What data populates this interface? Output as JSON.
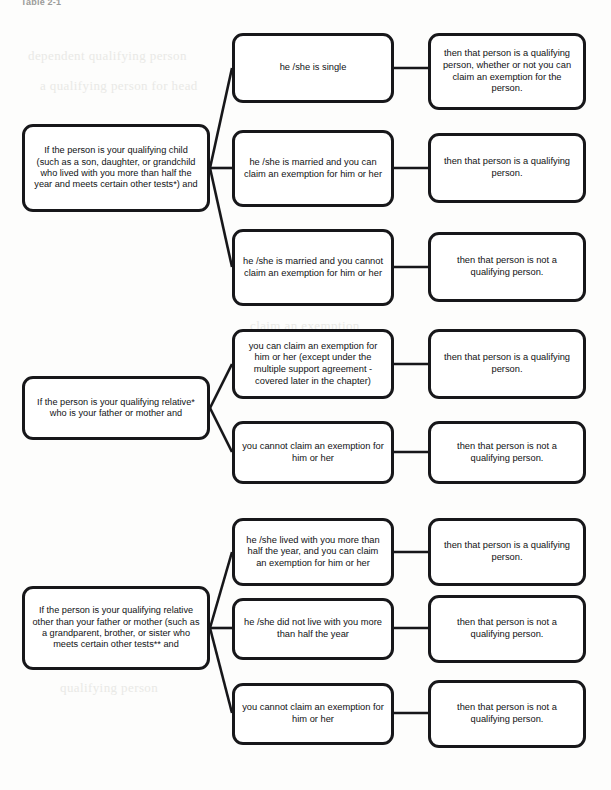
{
  "page": {
    "title": "Table 2-1",
    "background_color": "#fdfdfc",
    "box_border_color": "#17171a",
    "text_color": "#111214",
    "ghost_text": [
      "dependent qualifying person",
      "a qualifying person for head",
      "claim an exemption",
      "then that person",
      "qualifying person"
    ]
  },
  "diagram": {
    "type": "decision-flowchart",
    "columns": [
      "condition",
      "sub-condition",
      "result"
    ],
    "groups": [
      {
        "id": "qualifying-child",
        "condition": "If the person is your qualifying child (such as a son, daughter, or grandchild who lived with you more than half the year and meets certain other tests*) and",
        "branches": [
          {
            "id": "child-single",
            "sub_condition": "he /she is single",
            "result": "then that person is a qualifying person, whether or not you can claim an exemption for the person."
          },
          {
            "id": "child-married-can-claim",
            "sub_condition": "he /she is married and you can claim an exemption for him or her",
            "result": "then that person is a qualifying person."
          },
          {
            "id": "child-married-cannot-claim",
            "sub_condition": "he /she is married and you cannot claim an exemption for him or her",
            "result": "then that person is not a qualifying person."
          }
        ]
      },
      {
        "id": "qualifying-relative-parent",
        "condition": "If the person is your qualifying relative* who is your father or mother and",
        "branches": [
          {
            "id": "parent-can-claim",
            "sub_condition": "you can claim an exemption for him or her (except under the multiple support agreement - covered later in the chapter)",
            "result": "then that person is a qualifying person."
          },
          {
            "id": "parent-cannot-claim",
            "sub_condition": "you cannot claim an exemption for him or her",
            "result": "then that person is not a qualifying person."
          }
        ]
      },
      {
        "id": "qualifying-relative-other",
        "condition": "If the person is your qualifying relative other than your father or mother (such as a grandparent, brother, or sister who meets certain other tests** and",
        "branches": [
          {
            "id": "other-lived-and-claim",
            "sub_condition": "he /she lived with you more than half the year, and you can claim an exemption for him or her",
            "result": "then that person is a qualifying person."
          },
          {
            "id": "other-did-not-live",
            "sub_condition": "he /she did not live with you more than half the year",
            "result": "then that person is not a qualifying person."
          },
          {
            "id": "other-cannot-claim",
            "sub_condition": "you cannot claim an exemption for him or her",
            "result": "then that person is not a qualifying person."
          }
        ]
      }
    ]
  }
}
